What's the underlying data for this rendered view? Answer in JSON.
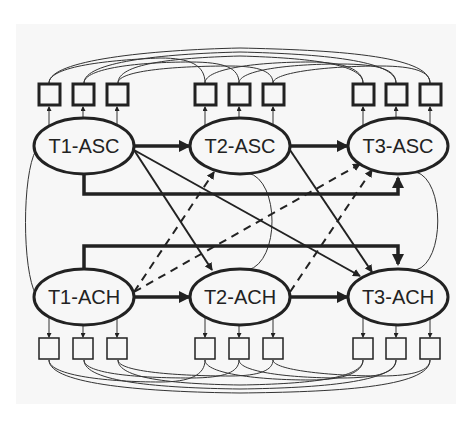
{
  "diagram": {
    "type": "structural-equation-path-model",
    "colors": {
      "background": "#ffffff",
      "panel": "#f7f7f7",
      "stroke": "#222222"
    },
    "latent_nodes": [
      {
        "id": "T1-ASC",
        "label": "T1-ASC",
        "row": "top",
        "col": 1
      },
      {
        "id": "T2-ASC",
        "label": "T2-ASC",
        "row": "top",
        "col": 2
      },
      {
        "id": "T3-ASC",
        "label": "T3-ASC",
        "row": "top",
        "col": 3
      },
      {
        "id": "T1-ACH",
        "label": "T1-ACH",
        "row": "bottom",
        "col": 1
      },
      {
        "id": "T2-ACH",
        "label": "T2-ACH",
        "row": "bottom",
        "col": 2
      },
      {
        "id": "T3-ACH",
        "label": "T3-ACH",
        "row": "bottom",
        "col": 3
      }
    ],
    "indicators_per_latent": 3,
    "edges": [
      {
        "from": "T1-ASC",
        "to": "T2-ASC",
        "style": "solid-thick"
      },
      {
        "from": "T2-ASC",
        "to": "T3-ASC",
        "style": "solid-thick"
      },
      {
        "from": "T1-ASC",
        "to": "T3-ASC",
        "style": "solid-thick-elbow"
      },
      {
        "from": "T1-ACH",
        "to": "T2-ACH",
        "style": "solid-thick"
      },
      {
        "from": "T2-ACH",
        "to": "T3-ACH",
        "style": "solid-thick"
      },
      {
        "from": "T1-ACH",
        "to": "T3-ACH",
        "style": "solid-thick-elbow"
      },
      {
        "from": "T1-ASC",
        "to": "T2-ACH",
        "style": "solid"
      },
      {
        "from": "T1-ASC",
        "to": "T3-ACH",
        "style": "solid"
      },
      {
        "from": "T2-ASC",
        "to": "T3-ACH",
        "style": "solid"
      },
      {
        "from": "T1-ACH",
        "to": "T2-ASC",
        "style": "dashed"
      },
      {
        "from": "T1-ACH",
        "to": "T3-ASC",
        "style": "dashed"
      },
      {
        "from": "T2-ACH",
        "to": "T3-ASC",
        "style": "dashed"
      }
    ],
    "covariances": [
      {
        "between": [
          "T1-ASC",
          "T1-ACH"
        ]
      },
      {
        "between": [
          "T2-ASC",
          "T2-ACH"
        ]
      },
      {
        "between": [
          "T3-ASC",
          "T3-ACH"
        ]
      }
    ]
  }
}
